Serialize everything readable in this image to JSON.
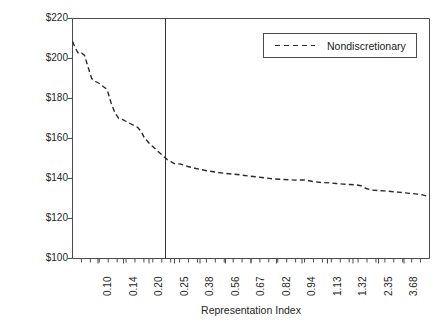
{
  "figure": {
    "ghost_text": "",
    "background_color": "#ffffff",
    "line_color": "#2a2a2a",
    "axis_color": "#4a4a4a"
  },
  "legend": {
    "position": "top-right",
    "entries": [
      {
        "label": "Nondiscretionary",
        "style": "dashed",
        "icon": "dashed-line-swatch"
      }
    ]
  },
  "axes": {
    "y_title": "Per Capita Outlays",
    "x_title": "Representation Index"
  },
  "chart_data": {
    "type": "line",
    "title": "",
    "subtitle": "",
    "xlabel": "Representation Index",
    "ylabel": "Per Capita Outlays",
    "grid": false,
    "legend_position": "top-right",
    "x_is_categorical": true,
    "ylim": [
      100,
      220
    ],
    "y_ticks": [
      100,
      120,
      140,
      160,
      180,
      200,
      220
    ],
    "y_tick_labels": [
      "$100",
      "$120",
      "$140",
      "$160",
      "$180",
      "$200",
      "$220"
    ],
    "x_tick_labels": [
      "0.10",
      "0.14",
      "0.20",
      "0.25",
      "0.38",
      "0.56",
      "0.67",
      "0.82",
      "0.94",
      "1.13",
      "1.32",
      "2.35",
      "3.68"
    ],
    "x_minor_tick_count": 39,
    "annotations": [
      {
        "type": "vertical-line",
        "label": "",
        "x_fraction": 0.2605
      }
    ],
    "series": [
      {
        "name": "Nondiscretionary",
        "style": "dashed",
        "color": "#2a2a2a",
        "points": [
          {
            "x": 0.0,
            "y": 208.5
          },
          {
            "x": 0.011,
            "y": 205.0
          },
          {
            "x": 0.022,
            "y": 202.5
          },
          {
            "x": 0.033,
            "y": 202.8
          },
          {
            "x": 0.044,
            "y": 201.5
          },
          {
            "x": 0.056,
            "y": 196.0
          },
          {
            "x": 0.07,
            "y": 190.0
          },
          {
            "x": 0.084,
            "y": 188.5
          },
          {
            "x": 0.098,
            "y": 187.5
          },
          {
            "x": 0.112,
            "y": 186.0
          },
          {
            "x": 0.126,
            "y": 184.5
          },
          {
            "x": 0.14,
            "y": 178.0
          },
          {
            "x": 0.154,
            "y": 173.0
          },
          {
            "x": 0.168,
            "y": 170.0
          },
          {
            "x": 0.182,
            "y": 169.5
          },
          {
            "x": 0.196,
            "y": 168.5
          },
          {
            "x": 0.21,
            "y": 167.5
          },
          {
            "x": 0.224,
            "y": 166.5
          },
          {
            "x": 0.238,
            "y": 165.5
          },
          {
            "x": 0.252,
            "y": 163.0
          },
          {
            "x": 0.261,
            "y": 160.5
          },
          {
            "x": 0.28,
            "y": 157.5
          },
          {
            "x": 0.3,
            "y": 155.0
          },
          {
            "x": 0.32,
            "y": 152.5
          },
          {
            "x": 0.345,
            "y": 149.5
          },
          {
            "x": 0.37,
            "y": 147.5
          },
          {
            "x": 0.395,
            "y": 147.2
          },
          {
            "x": 0.42,
            "y": 146.0
          },
          {
            "x": 0.45,
            "y": 145.0
          },
          {
            "x": 0.485,
            "y": 144.0
          },
          {
            "x": 0.52,
            "y": 143.2
          },
          {
            "x": 0.56,
            "y": 142.5
          },
          {
            "x": 0.6,
            "y": 142.0
          },
          {
            "x": 0.645,
            "y": 141.2
          },
          {
            "x": 0.69,
            "y": 140.5
          },
          {
            "x": 0.73,
            "y": 139.8
          },
          {
            "x": 0.77,
            "y": 139.5
          },
          {
            "x": 0.81,
            "y": 139.2
          },
          {
            "x": 0.845,
            "y": 139.3
          },
          {
            "x": 0.875,
            "y": 138.5
          },
          {
            "x": 0.905,
            "y": 138.0
          },
          {
            "x": 0.935,
            "y": 137.8
          },
          {
            "x": 0.96,
            "y": 137.5
          },
          {
            "x": 0.985,
            "y": 137.2
          },
          {
            "x": 1.01,
            "y": 137.0
          },
          {
            "x": 1.032,
            "y": 136.8
          },
          {
            "x": 1.05,
            "y": 136.4
          },
          {
            "x": 1.07,
            "y": 135.0
          },
          {
            "x": 1.09,
            "y": 134.2
          },
          {
            "x": 1.11,
            "y": 134.0
          },
          {
            "x": 1.135,
            "y": 133.8
          },
          {
            "x": 1.16,
            "y": 133.5
          },
          {
            "x": 1.185,
            "y": 133.2
          },
          {
            "x": 1.21,
            "y": 132.8
          },
          {
            "x": 1.235,
            "y": 132.5
          },
          {
            "x": 1.255,
            "y": 132.2
          },
          {
            "x": 1.275,
            "y": 131.8
          },
          {
            "x": 1.29,
            "y": 131.2
          },
          {
            "x": 1.3,
            "y": 131.0
          }
        ]
      }
    ]
  }
}
